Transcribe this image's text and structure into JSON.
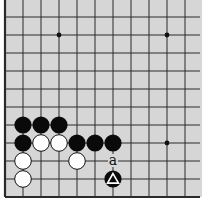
{
  "diagram": {
    "type": "go-board-fragment",
    "board_color": "#d6d6d6",
    "line_color": "#2a2a2a",
    "grid": {
      "origin_x": 5,
      "origin_y": 17,
      "spacing": 18,
      "cols": 11,
      "rows": 11,
      "left_edge": true,
      "bottom_edge": true,
      "top_edge": false,
      "right_edge": false
    },
    "star_points": [
      {
        "col": 3,
        "row": 1
      },
      {
        "col": 9,
        "row": 1
      },
      {
        "col": 9,
        "row": 7
      }
    ],
    "stones": [
      {
        "color": "black",
        "col": 1,
        "row": 6
      },
      {
        "color": "black",
        "col": 2,
        "row": 6
      },
      {
        "color": "black",
        "col": 3,
        "row": 6
      },
      {
        "color": "black",
        "col": 1,
        "row": 7
      },
      {
        "color": "white",
        "col": 2,
        "row": 7
      },
      {
        "color": "white",
        "col": 3,
        "row": 7
      },
      {
        "color": "black",
        "col": 4,
        "row": 7
      },
      {
        "color": "black",
        "col": 5,
        "row": 7
      },
      {
        "color": "black",
        "col": 6,
        "row": 7
      },
      {
        "color": "white",
        "col": 1,
        "row": 8
      },
      {
        "color": "white",
        "col": 4,
        "row": 8
      },
      {
        "color": "white",
        "col": 1,
        "row": 9
      },
      {
        "color": "black",
        "col": 6,
        "row": 9,
        "marker": "triangle"
      }
    ],
    "labels": [
      {
        "text": "a",
        "col": 6,
        "row": 8
      }
    ]
  }
}
